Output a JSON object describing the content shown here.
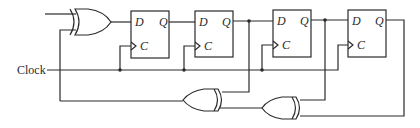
{
  "diagram": {
    "type": "circuit",
    "clock_label": "Clock",
    "flip_flops": [
      {
        "id": "ff1",
        "d_label": "D",
        "q_label": "Q",
        "c_label": "C"
      },
      {
        "id": "ff2",
        "d_label": "D",
        "q_label": "Q",
        "c_label": "C"
      },
      {
        "id": "ff3",
        "d_label": "D",
        "q_label": "Q",
        "c_label": "C"
      },
      {
        "id": "ff4",
        "d_label": "D",
        "q_label": "Q",
        "c_label": "C"
      }
    ],
    "gates": [
      {
        "id": "xor-input",
        "type": "XOR"
      },
      {
        "id": "xor-feedback-left",
        "type": "XOR"
      },
      {
        "id": "xor-feedback-right",
        "type": "XOR"
      }
    ],
    "colors": {
      "line": "#2a2a2a",
      "background": "#ffffff"
    }
  }
}
